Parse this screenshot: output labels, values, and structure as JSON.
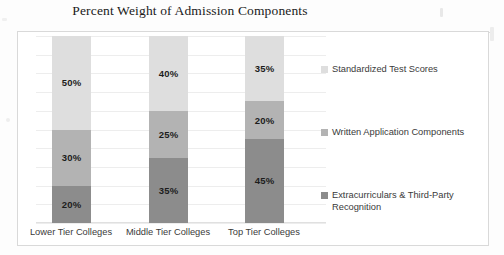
{
  "chart_data": {
    "type": "bar",
    "subtype": "stacked-bar-100",
    "title": "Percent Weight of Admission Components",
    "xlabel": "",
    "ylabel": "",
    "ylim": [
      0,
      100
    ],
    "grid": true,
    "gridline_step": 10,
    "legend_position": "right",
    "categories": [
      "Lower Tier Colleges",
      "Middle Tier Colleges",
      "Top Tier Colleges"
    ],
    "series": [
      {
        "name": "Extracurriculars & Third-Party Recognition",
        "color": "#8c8c8c",
        "values": [
          20,
          35,
          45
        ],
        "labels": [
          "20%",
          "35%",
          "45%"
        ]
      },
      {
        "name": "Written Application Components",
        "color": "#b3b3b3",
        "values": [
          30,
          25,
          20
        ],
        "labels": [
          "30%",
          "25%",
          "20%"
        ]
      },
      {
        "name": "Standardized Test Scores",
        "color": "#dedede",
        "values": [
          50,
          40,
          35
        ],
        "labels": [
          "50%",
          "40%",
          "35%"
        ]
      }
    ],
    "legend_entries": [
      {
        "label": "Standardized Test Scores",
        "color": "#dedede"
      },
      {
        "label": "Written Application Components",
        "color": "#b3b3b3"
      },
      {
        "label": "Extracurriculars & Third-Party Recognition",
        "color": "#8c8c8c"
      }
    ]
  },
  "chart": {
    "title": "Percent Weight of Admission Components",
    "bars": [
      {
        "category": "Lower Tier Colleges",
        "segments": [
          {
            "series": "Standardized Test Scores",
            "label": "50%",
            "value": 50
          },
          {
            "series": "Written Application Components",
            "label": "30%",
            "value": 30
          },
          {
            "series": "Extracurriculars & Third-Party Recognition",
            "label": "20%",
            "value": 20
          }
        ]
      },
      {
        "category": "Middle Tier Colleges",
        "segments": [
          {
            "series": "Standardized Test Scores",
            "label": "40%",
            "value": 40
          },
          {
            "series": "Written Application Components",
            "label": "25%",
            "value": 25
          },
          {
            "series": "Extracurriculars & Third-Party Recognition",
            "label": "35%",
            "value": 35
          }
        ]
      },
      {
        "category": "Top Tier Colleges",
        "segments": [
          {
            "series": "Standardized Test Scores",
            "label": "35%",
            "value": 35
          },
          {
            "series": "Written Application Components",
            "label": "20%",
            "value": 20
          },
          {
            "series": "Extracurriculars & Third-Party Recognition",
            "label": "45%",
            "value": 45
          }
        ]
      }
    ],
    "legend": [
      {
        "label": "Standardized Test Scores"
      },
      {
        "label": "Written Application Components"
      },
      {
        "label": "Extracurriculars & Third-Party Recognition"
      }
    ]
  },
  "colors": {
    "series_light": "#dedede",
    "series_mid": "#b3b3b3",
    "series_dark": "#8c8c8c",
    "gridline": "#ededed",
    "frame_border": "#d9d9d9",
    "text": "#3a3a3a",
    "title_text": "#1a1a1a"
  }
}
